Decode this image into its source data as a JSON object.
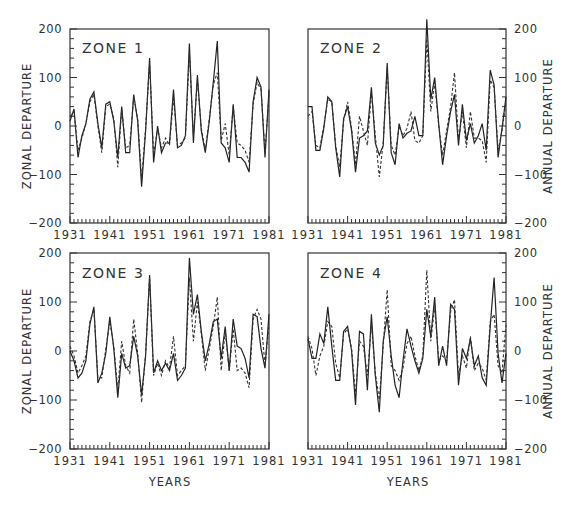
{
  "chart_data": [
    {
      "type": "line",
      "title": "ZONE 1",
      "xlabel": "",
      "ylabel": "ZONAL DEPARTURE",
      "ylabel_right": "",
      "xlim": [
        1931,
        1981
      ],
      "ylim": [
        -200,
        200
      ],
      "xticks": [
        "1931",
        "1941",
        "1951",
        "1961",
        "1971",
        "1981"
      ],
      "yticks": [
        200,
        100,
        0,
        -100,
        -200
      ],
      "grid": false,
      "legend": "none",
      "x": [
        1931,
        1932,
        1933,
        1934,
        1935,
        1936,
        1937,
        1938,
        1939,
        1940,
        1941,
        1942,
        1943,
        1944,
        1945,
        1946,
        1947,
        1948,
        1949,
        1950,
        1951,
        1952,
        1953,
        1954,
        1955,
        1956,
        1957,
        1958,
        1959,
        1960,
        1961,
        1962,
        1963,
        1964,
        1965,
        1966,
        1967,
        1968,
        1969,
        1970,
        1971,
        1972,
        1973,
        1974,
        1975,
        1976,
        1977,
        1978,
        1979,
        1980,
        1981
      ],
      "series": [
        {
          "name": "zonal (solid)",
          "style": "solid",
          "values": [
            10,
            35,
            -65,
            -20,
            5,
            55,
            70,
            5,
            -45,
            45,
            50,
            10,
            -65,
            40,
            -55,
            -55,
            65,
            10,
            -125,
            -10,
            140,
            -75,
            0,
            -55,
            -35,
            -35,
            75,
            -45,
            -40,
            -20,
            170,
            -35,
            105,
            -10,
            -55,
            10,
            90,
            175,
            -35,
            -45,
            -75,
            45,
            -65,
            -65,
            -75,
            -95,
            50,
            100,
            80,
            -65,
            75
          ]
        },
        {
          "name": "annual (dashed)",
          "style": "dashed",
          "values": [
            20,
            30,
            -50,
            -25,
            5,
            50,
            65,
            0,
            -55,
            40,
            45,
            15,
            -85,
            35,
            -45,
            -40,
            60,
            15,
            -110,
            -5,
            130,
            -60,
            -5,
            -45,
            -25,
            -40,
            60,
            -40,
            -35,
            -25,
            150,
            -20,
            95,
            -5,
            -50,
            15,
            85,
            110,
            -30,
            5,
            -60,
            40,
            -35,
            -40,
            -50,
            -75,
            45,
            90,
            75,
            -55,
            65
          ]
        }
      ]
    },
    {
      "type": "line",
      "title": "ZONE 2",
      "xlabel": "",
      "ylabel": "",
      "ylabel_right": "ANNUAL DEPARTURE",
      "xlim": [
        1931,
        1981
      ],
      "ylim": [
        -200,
        200
      ],
      "xticks": [
        "1931",
        "1941",
        "1951",
        "1961",
        "1971",
        "1981"
      ],
      "yticks": [
        200,
        100,
        0,
        -100,
        -200
      ],
      "grid": false,
      "legend": "none",
      "x": [
        1931,
        1932,
        1933,
        1934,
        1935,
        1936,
        1937,
        1938,
        1939,
        1940,
        1941,
        1942,
        1943,
        1944,
        1945,
        1946,
        1947,
        1948,
        1949,
        1950,
        1951,
        1952,
        1953,
        1954,
        1955,
        1956,
        1957,
        1958,
        1959,
        1960,
        1961,
        1962,
        1963,
        1964,
        1965,
        1966,
        1967,
        1968,
        1969,
        1970,
        1971,
        1972,
        1973,
        1974,
        1975,
        1976,
        1977,
        1978,
        1979,
        1980,
        1981
      ],
      "series": [
        {
          "name": "zonal (solid)",
          "style": "solid",
          "values": [
            40,
            40,
            -50,
            -50,
            -5,
            60,
            50,
            -45,
            -105,
            15,
            40,
            -10,
            -95,
            -25,
            -20,
            -10,
            80,
            -35,
            -60,
            -40,
            130,
            -55,
            -80,
            5,
            -25,
            -15,
            -10,
            20,
            -20,
            -20,
            220,
            55,
            100,
            5,
            -80,
            -20,
            30,
            65,
            -40,
            45,
            -30,
            5,
            -35,
            -20,
            5,
            -50,
            115,
            85,
            -65,
            -5,
            60
          ]
        },
        {
          "name": "annual (dashed)",
          "style": "dashed",
          "values": [
            20,
            30,
            -40,
            -45,
            0,
            55,
            50,
            -40,
            -85,
            10,
            50,
            -5,
            -80,
            20,
            -10,
            -40,
            70,
            -20,
            -105,
            -35,
            120,
            -40,
            -60,
            0,
            -20,
            -5,
            30,
            -30,
            -35,
            -20,
            180,
            30,
            90,
            0,
            -60,
            -10,
            40,
            110,
            -30,
            30,
            -45,
            30,
            -25,
            -25,
            -30,
            -75,
            95,
            80,
            -50,
            -10,
            50
          ]
        }
      ]
    },
    {
      "type": "line",
      "title": "ZONE 3",
      "xlabel": "YEARS",
      "ylabel": "ZONAL DEPARTURE",
      "ylabel_right": "",
      "xlim": [
        1931,
        1981
      ],
      "ylim": [
        -200,
        200
      ],
      "xticks": [
        "1931",
        "1941",
        "1951",
        "1961",
        "1971",
        "1981"
      ],
      "yticks": [
        200,
        100,
        0,
        -100,
        -200
      ],
      "grid": false,
      "legend": "none",
      "x": [
        1931,
        1932,
        1933,
        1934,
        1935,
        1936,
        1937,
        1938,
        1939,
        1940,
        1941,
        1942,
        1943,
        1944,
        1945,
        1946,
        1947,
        1948,
        1949,
        1950,
        1951,
        1952,
        1953,
        1954,
        1955,
        1956,
        1957,
        1958,
        1959,
        1960,
        1961,
        1962,
        1963,
        1964,
        1965,
        1966,
        1967,
        1968,
        1969,
        1970,
        1971,
        1972,
        1973,
        1974,
        1975,
        1976,
        1977,
        1978,
        1979,
        1980,
        1981
      ],
      "series": [
        {
          "name": "zonal (solid)",
          "style": "solid",
          "values": [
            0,
            -20,
            -55,
            -45,
            -20,
            55,
            90,
            -65,
            -45,
            -5,
            70,
            5,
            -95,
            -5,
            -35,
            -30,
            30,
            -10,
            -90,
            -10,
            155,
            -45,
            -20,
            -40,
            -25,
            -40,
            -5,
            -60,
            -50,
            -35,
            190,
            75,
            115,
            40,
            -20,
            15,
            60,
            65,
            -15,
            50,
            -40,
            65,
            10,
            5,
            -15,
            -55,
            75,
            70,
            5,
            -35,
            75
          ]
        },
        {
          "name": "annual (dashed)",
          "style": "dashed",
          "values": [
            10,
            -10,
            -45,
            -30,
            -10,
            60,
            85,
            -55,
            -55,
            5,
            60,
            10,
            -80,
            20,
            -30,
            -45,
            65,
            -5,
            -105,
            -5,
            150,
            -50,
            -25,
            -50,
            -20,
            -35,
            30,
            -50,
            -40,
            -30,
            150,
            20,
            100,
            35,
            -40,
            5,
            50,
            110,
            -40,
            40,
            -40,
            45,
            -40,
            -35,
            -45,
            -75,
            65,
            85,
            65,
            -30,
            55
          ]
        }
      ]
    },
    {
      "type": "line",
      "title": "ZONE 4",
      "xlabel": "YEARS",
      "ylabel": "",
      "ylabel_right": "ANNUAL DEPARTURE",
      "xlim": [
        1931,
        1981
      ],
      "ylim": [
        -200,
        200
      ],
      "xticks": [
        "1931",
        "1941",
        "1951",
        "1961",
        "1971",
        "1981"
      ],
      "yticks": [
        200,
        100,
        0,
        -100,
        -200
      ],
      "grid": false,
      "legend": "none",
      "x": [
        1931,
        1932,
        1933,
        1934,
        1935,
        1936,
        1937,
        1938,
        1939,
        1940,
        1941,
        1942,
        1943,
        1944,
        1945,
        1946,
        1947,
        1948,
        1949,
        1950,
        1951,
        1952,
        1953,
        1954,
        1955,
        1956,
        1957,
        1958,
        1959,
        1960,
        1961,
        1962,
        1963,
        1964,
        1965,
        1966,
        1967,
        1968,
        1969,
        1970,
        1971,
        1972,
        1973,
        1974,
        1975,
        1976,
        1977,
        1978,
        1979,
        1980,
        1981
      ],
      "series": [
        {
          "name": "zonal (solid)",
          "style": "solid",
          "values": [
            25,
            -15,
            -15,
            35,
            15,
            90,
            10,
            -60,
            -60,
            40,
            50,
            0,
            -110,
            40,
            35,
            -80,
            75,
            -50,
            -125,
            20,
            70,
            -10,
            -70,
            -95,
            -20,
            45,
            10,
            -20,
            -45,
            -15,
            85,
            30,
            110,
            -30,
            10,
            -30,
            95,
            85,
            -70,
            5,
            -15,
            25,
            -30,
            -10,
            -55,
            -70,
            50,
            150,
            -5,
            -65,
            -5
          ]
        },
        {
          "name": "annual (dashed)",
          "style": "dashed",
          "values": [
            30,
            5,
            -50,
            -10,
            10,
            60,
            50,
            -25,
            -55,
            35,
            45,
            5,
            -90,
            20,
            10,
            -50,
            55,
            -45,
            -100,
            10,
            125,
            -30,
            -40,
            -60,
            -35,
            15,
            30,
            -10,
            -40,
            -10,
            165,
            20,
            90,
            -20,
            -10,
            -20,
            80,
            105,
            -50,
            -10,
            -35,
            30,
            -40,
            -25,
            -35,
            -60,
            60,
            75,
            -30,
            -45,
            55
          ]
        }
      ]
    }
  ],
  "panels": [
    {
      "title": "ZONE 1",
      "left_label": "ZONAL DEPARTURE",
      "right_label": "",
      "bottom_label": ""
    },
    {
      "title": "ZONE 2",
      "left_label": "",
      "right_label": "ANNUAL DEPARTURE",
      "bottom_label": ""
    },
    {
      "title": "ZONE 3",
      "left_label": "ZONAL DEPARTURE",
      "right_label": "",
      "bottom_label": "YEARS"
    },
    {
      "title": "ZONE 4",
      "left_label": "",
      "right_label": "ANNUAL DEPARTURE",
      "bottom_label": "YEARS"
    }
  ],
  "colors": {
    "line": "#222222",
    "frame": "#333333",
    "background": "#ffffff"
  }
}
